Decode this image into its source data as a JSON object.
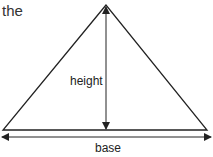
{
  "fragment_text": "the",
  "diagram": {
    "shape": "triangle",
    "labels": {
      "height": "height",
      "base": "base"
    },
    "colors": {
      "stroke": "#222222",
      "text": "#222222",
      "background": "#ffffff"
    }
  }
}
